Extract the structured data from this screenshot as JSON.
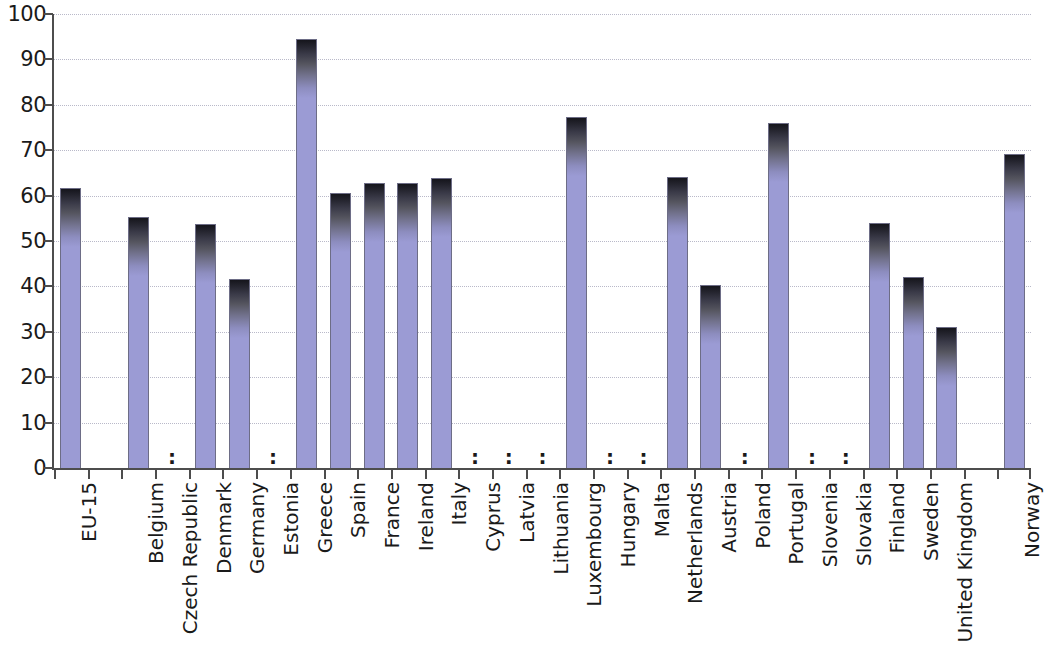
{
  "chart_data": {
    "type": "bar",
    "title": "",
    "subtitle": "",
    "xlabel": "",
    "ylabel": "",
    "ylim": [
      0,
      100
    ],
    "yticks": [
      0,
      10,
      20,
      30,
      40,
      50,
      60,
      70,
      80,
      90,
      100
    ],
    "ytick_labels": [
      "0",
      "10",
      "20",
      "30",
      "40",
      "50",
      "60",
      "70",
      "80",
      "90",
      "100"
    ],
    "grid": "horizontal-dotted",
    "legend": "none",
    "missing_symbol": ":",
    "bar_color": "#9b9bd4",
    "bar_gradient_top_color": "#15151c",
    "bar_edge_color": "#6d6d86",
    "axis_color": "#4d4d4d",
    "gridline_color": "#b9b9c9",
    "categories": [
      "EU-15",
      "",
      "Belgium",
      "Czech Republic",
      "Denmark",
      "Germany",
      "Estonia",
      "Greece",
      "Spain",
      "France",
      "Ireland",
      "Italy",
      "Cyprus",
      "Latvia",
      "Lithuania",
      "Luxembourg",
      "Hungary",
      "Malta",
      "Netherlands",
      "Austria",
      "Poland",
      "Portugal",
      "Slovenia",
      "Slovakia",
      "Finland",
      "Sweden",
      "United Kingdom",
      "",
      "Norway"
    ],
    "values": [
      62.0,
      null,
      55.5,
      null,
      54.0,
      41.8,
      null,
      94.7,
      60.8,
      63.0,
      63.0,
      64.0,
      null,
      null,
      null,
      77.5,
      null,
      null,
      64.3,
      40.5,
      null,
      76.2,
      null,
      null,
      54.2,
      42.2,
      31.2,
      null,
      69.4
    ]
  }
}
